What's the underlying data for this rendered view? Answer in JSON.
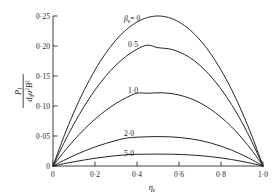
{
  "chart_data": {
    "type": "line",
    "title": "",
    "subtitle": "",
    "xlabel": "ηe",
    "ylabel": "P1 / (d0 u² B²)",
    "xlim": [
      0,
      1.0
    ],
    "ylim": [
      0,
      0.25
    ],
    "grid": false,
    "legend_position": "inline-curve-labels",
    "x_ticks": [
      0,
      0.2,
      0.4,
      0.6,
      0.8,
      1.0
    ],
    "x_tick_labels": [
      "0",
      "0·2",
      "0·4",
      "0·6",
      "0·8",
      "1·0"
    ],
    "y_ticks": [
      0,
      0.05,
      0.1,
      0.15,
      0.2,
      0.25
    ],
    "y_tick_labels": [
      "0",
      "0·05",
      "0·10",
      "0·15",
      "0·20",
      "0·25"
    ],
    "x": [
      0,
      0.05,
      0.1,
      0.15,
      0.2,
      0.25,
      0.3,
      0.35,
      0.4,
      0.45,
      0.5,
      0.55,
      0.6,
      0.65,
      0.7,
      0.75,
      0.8,
      0.85,
      0.9,
      0.95,
      1.0
    ],
    "series": [
      {
        "name": "βe = 0",
        "label": "βe = 0",
        "peak_x": 0.5,
        "peak_y": 0.25,
        "values": [
          0,
          0.0475,
          0.09,
          0.1275,
          0.16,
          0.1875,
          0.21,
          0.2275,
          0.24,
          0.2475,
          0.25,
          0.2475,
          0.24,
          0.2275,
          0.21,
          0.1875,
          0.16,
          0.1275,
          0.09,
          0.0475,
          0
        ]
      },
      {
        "name": "βe = 0·5",
        "label": "0·5",
        "peak_x": 0.5,
        "peak_y": 0.197,
        "values": [
          0,
          0.0369,
          0.0704,
          0.1003,
          0.1266,
          0.1492,
          0.1682,
          0.1834,
          0.1946,
          0.2015,
          0.1971,
          0.1955,
          0.1902,
          0.181,
          0.1676,
          0.15,
          0.1284,
          0.1026,
          0.0727,
          0.0384,
          0
        ]
      },
      {
        "name": "βe = 1·0",
        "label": "1·0",
        "peak_x": 0.5,
        "peak_y": 0.122,
        "values": [
          0,
          0.0226,
          0.0432,
          0.0617,
          0.0781,
          0.0923,
          0.1043,
          0.1141,
          0.1214,
          0.1213,
          0.122,
          0.1213,
          0.1183,
          0.1131,
          0.1053,
          0.0947,
          0.0814,
          0.0653,
          0.0464,
          0.0246,
          0
        ]
      },
      {
        "name": "βe = 2·0",
        "label": "2·0",
        "peak_x": 0.5,
        "peak_y": 0.049,
        "values": [
          0,
          0.0091,
          0.0175,
          0.025,
          0.0317,
          0.0375,
          0.0425,
          0.0466,
          0.048,
          0.0487,
          0.049,
          0.0487,
          0.0476,
          0.0456,
          0.0426,
          0.0384,
          0.0331,
          0.0266,
          0.0189,
          0.01,
          0
        ]
      },
      {
        "name": "βe = 5·0",
        "label": "5·0",
        "peak_x": 0.5,
        "peak_y": 0.0198,
        "values": [
          0,
          0.0037,
          0.0071,
          0.0101,
          0.0129,
          0.0152,
          0.0172,
          0.0188,
          0.0195,
          0.0197,
          0.0198,
          0.0197,
          0.0193,
          0.0185,
          0.0173,
          0.0156,
          0.0135,
          0.0108,
          0.0077,
          0.0041,
          0
        ]
      }
    ]
  },
  "ylabel_parts": {
    "numerator_main": "P",
    "numerator_sub": "1",
    "denominator_d": "d",
    "denominator_d_sub": "0",
    "denominator_u": "u",
    "denominator_u_sup": "2",
    "denominator_B": "B",
    "denominator_B_sup": "2"
  },
  "xlabel_parts": {
    "main": "η",
    "sub": "e"
  },
  "curve_labels": {
    "beta_prefix": "β",
    "beta_sub": "e",
    "beta_eq_zero": "= 0",
    "c1": "0·5",
    "c2": "1·0",
    "c3": "2·0",
    "c4": "5·0"
  },
  "colors": {
    "curve": "#1a1a1a",
    "axis": "#2a2a2a",
    "background": "#ffffff"
  }
}
